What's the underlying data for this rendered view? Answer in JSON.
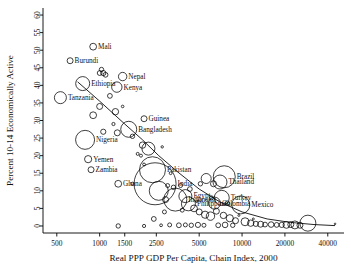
{
  "chart_data": {
    "type": "scatter",
    "title": "",
    "xlabel": "Real PPP GDP Per Capita, Chain Index, 2000",
    "ylabel": "Percent 10-14 Economically Active",
    "xscale": "log",
    "xlim": [
      400,
      52000
    ],
    "ylim": [
      -2,
      62
    ],
    "grid": false,
    "legend": "none",
    "xticks": [
      500,
      1000,
      1500,
      2500,
      5000,
      10000,
      20000,
      40000
    ],
    "xticklabels": [
      "500",
      "1000",
      "1500",
      "2500",
      "5000",
      "10000",
      "20000",
      "40000"
    ],
    "yticks": [
      0,
      5,
      10,
      15,
      20,
      25,
      30,
      35,
      40,
      45,
      50,
      55,
      60
    ],
    "yticklabels": [
      "0",
      "5",
      "10",
      "15",
      "20",
      "25",
      "30",
      "35",
      "40",
      "45",
      "50",
      "55",
      "60"
    ],
    "marker": "open-circle",
    "size_encoding": "bubble area proportional to population",
    "fit_line": {
      "label": "fitted trend",
      "points": [
        [
          700,
          41.0
        ],
        [
          1000,
          35.5
        ],
        [
          1500,
          29.0
        ],
        [
          2000,
          24.5
        ],
        [
          2600,
          20.0
        ],
        [
          3500,
          15.5
        ],
        [
          5000,
          10.5
        ],
        [
          7000,
          6.8
        ],
        [
          10000,
          4.0
        ],
        [
          15000,
          2.0
        ],
        [
          22000,
          1.0
        ],
        [
          32000,
          0.4
        ],
        [
          45000,
          0.1
        ]
      ]
    },
    "labeled_points": [
      {
        "label": "Mali",
        "x": 900,
        "y": 51.0,
        "r": 3.4
      },
      {
        "label": "Burundi",
        "x": 620,
        "y": 47.0,
        "r": 3.0
      },
      {
        "label": "Nepal",
        "x": 1450,
        "y": 42.5,
        "r": 4.2
      },
      {
        "label": "Ethiopia",
        "x": 760,
        "y": 40.5,
        "r": 7.0
      },
      {
        "label": "Kenya",
        "x": 1320,
        "y": 39.5,
        "r": 5.2
      },
      {
        "label": "Tanzania",
        "x": 530,
        "y": 36.5,
        "r": 6.0
      },
      {
        "label": "Guinea",
        "x": 2050,
        "y": 30.5,
        "r": 3.0
      },
      {
        "label": "Bangladesh",
        "x": 1600,
        "y": 27.5,
        "r": 8.0
      },
      {
        "label": "Nigeria",
        "x": 790,
        "y": 24.5,
        "r": 9.5
      },
      {
        "label": "Yemen",
        "x": 830,
        "y": 19.0,
        "r": 3.6
      },
      {
        "label": "Zambia",
        "x": 870,
        "y": 16.0,
        "r": 3.0
      },
      {
        "label": "Ghana",
        "x": 1350,
        "y": 12.0,
        "r": 3.4
      },
      {
        "label": "Pakistan",
        "x": 2350,
        "y": 16.0,
        "r": 13.0
      },
      {
        "label": "India",
        "x": 2450,
        "y": 12.0,
        "r": 21.0
      },
      {
        "label": "Brazil",
        "x": 7500,
        "y": 14.0,
        "r": 11.0
      },
      {
        "label": "Thailand",
        "x": 7000,
        "y": 12.5,
        "r": 7.0
      },
      {
        "label": "Egypt",
        "x": 4000,
        "y": 8.5,
        "r": 6.5
      },
      {
        "label": "Indonesia",
        "x": 3400,
        "y": 7.5,
        "r": 11.5
      },
      {
        "label": "Philippines",
        "x": 4200,
        "y": 6.3,
        "r": 7.0
      },
      {
        "label": "Turkey",
        "x": 7200,
        "y": 8.0,
        "r": 7.5
      },
      {
        "label": "Colombia",
        "x": 6400,
        "y": 6.5,
        "r": 6.0
      },
      {
        "label": "Mexico",
        "x": 9800,
        "y": 6.0,
        "r": 9.0
      }
    ],
    "unlabeled_points": [
      {
        "x": 1000,
        "y": 43.5,
        "r": 2.4
      },
      {
        "x": 1060,
        "y": 43.5,
        "r": 2.6
      },
      {
        "x": 1030,
        "y": 44.5,
        "r": 2.2
      },
      {
        "x": 1100,
        "y": 43.0,
        "r": 2.4
      },
      {
        "x": 1180,
        "y": 37.0,
        "r": 2.4
      },
      {
        "x": 1000,
        "y": 34.0,
        "r": 3.0
      },
      {
        "x": 1290,
        "y": 32.5,
        "r": 3.2
      },
      {
        "x": 900,
        "y": 31.5,
        "r": 3.4
      },
      {
        "x": 1450,
        "y": 34.0,
        "r": 1.3
      },
      {
        "x": 1060,
        "y": 26.8,
        "r": 2.6
      },
      {
        "x": 1330,
        "y": 26.5,
        "r": 3.0
      },
      {
        "x": 1700,
        "y": 25.5,
        "r": 2.2
      },
      {
        "x": 2000,
        "y": 23.0,
        "r": 3.2
      },
      {
        "x": 1250,
        "y": 29.0,
        "r": 1.6
      },
      {
        "x": 1850,
        "y": 20.5,
        "r": 1.5
      },
      {
        "x": 1950,
        "y": 20.0,
        "r": 1.5
      },
      {
        "x": 2050,
        "y": 17.5,
        "r": 1.4
      },
      {
        "x": 2200,
        "y": 22.0,
        "r": 6.5
      },
      {
        "x": 2600,
        "y": 10.0,
        "r": 9.5
      },
      {
        "x": 2900,
        "y": 7.5,
        "r": 3.0
      },
      {
        "x": 3000,
        "y": 11.5,
        "r": 2.0
      },
      {
        "x": 3300,
        "y": 11.0,
        "r": 2.2
      },
      {
        "x": 3700,
        "y": 11.5,
        "r": 2.0
      },
      {
        "x": 4300,
        "y": 10.5,
        "r": 2.4
      },
      {
        "x": 5100,
        "y": 12.0,
        "r": 2.2
      },
      {
        "x": 5600,
        "y": 13.5,
        "r": 5.0
      },
      {
        "x": 6300,
        "y": 12.0,
        "r": 3.0
      },
      {
        "x": 4600,
        "y": 5.0,
        "r": 3.4
      },
      {
        "x": 5000,
        "y": 4.0,
        "r": 3.0
      },
      {
        "x": 5500,
        "y": 3.2,
        "r": 3.6
      },
      {
        "x": 6000,
        "y": 2.8,
        "r": 4.2
      },
      {
        "x": 6600,
        "y": 4.2,
        "r": 3.0
      },
      {
        "x": 7400,
        "y": 3.0,
        "r": 3.2
      },
      {
        "x": 8200,
        "y": 2.2,
        "r": 3.6
      },
      {
        "x": 9000,
        "y": 1.5,
        "r": 3.0
      },
      {
        "x": 10500,
        "y": 1.2,
        "r": 4.0
      },
      {
        "x": 11500,
        "y": 0.8,
        "r": 3.2
      },
      {
        "x": 12500,
        "y": 0.6,
        "r": 2.6
      },
      {
        "x": 13500,
        "y": 0.5,
        "r": 3.0
      },
      {
        "x": 14500,
        "y": 0.4,
        "r": 2.4
      },
      {
        "x": 16000,
        "y": 0.4,
        "r": 2.8
      },
      {
        "x": 17500,
        "y": 0.3,
        "r": 2.4
      },
      {
        "x": 19000,
        "y": 0.3,
        "r": 2.6
      },
      {
        "x": 20500,
        "y": 0.3,
        "r": 3.4
      },
      {
        "x": 22000,
        "y": 0.4,
        "r": 3.0
      },
      {
        "x": 23500,
        "y": 0.3,
        "r": 4.0
      },
      {
        "x": 25500,
        "y": 0.2,
        "r": 3.0
      },
      {
        "x": 29000,
        "y": 0.8,
        "r": 8.0
      },
      {
        "x": 45000,
        "y": 0.6,
        "r": 0.8
      },
      {
        "x": 1350,
        "y": 0.0,
        "r": 2.2
      },
      {
        "x": 2050,
        "y": 0.0,
        "r": 1.6
      },
      {
        "x": 2700,
        "y": 0.2,
        "r": 1.4
      },
      {
        "x": 3100,
        "y": 0.3,
        "r": 2.0
      },
      {
        "x": 3600,
        "y": 0.2,
        "r": 2.4
      },
      {
        "x": 4000,
        "y": 0.3,
        "r": 2.0
      },
      {
        "x": 4400,
        "y": 0.2,
        "r": 2.2
      },
      {
        "x": 4900,
        "y": 0.3,
        "r": 2.6
      },
      {
        "x": 5400,
        "y": 0.2,
        "r": 2.0
      },
      {
        "x": 6800,
        "y": 0.2,
        "r": 2.4
      },
      {
        "x": 7600,
        "y": 0.3,
        "r": 2.8
      },
      {
        "x": 8600,
        "y": 0.2,
        "r": 2.2
      },
      {
        "x": 3800,
        "y": 4.5,
        "r": 2.0
      },
      {
        "x": 4800,
        "y": 7.0,
        "r": 1.2
      },
      {
        "x": 2850,
        "y": 4.0,
        "r": 2.0
      },
      {
        "x": 9500,
        "y": 3.0,
        "r": 1.0
      },
      {
        "x": 12000,
        "y": 2.0,
        "r": 1.0
      },
      {
        "x": 2400,
        "y": 2.0,
        "r": 2.4
      },
      {
        "x": 6100,
        "y": 8.0,
        "r": 2.0
      },
      {
        "x": 7900,
        "y": 6.5,
        "r": 2.2
      },
      {
        "x": 3150,
        "y": 15.0,
        "r": 1.4
      },
      {
        "x": 1700,
        "y": 12.0,
        "r": 1.6
      },
      {
        "x": 2750,
        "y": 22.5,
        "r": 1.2
      }
    ]
  }
}
